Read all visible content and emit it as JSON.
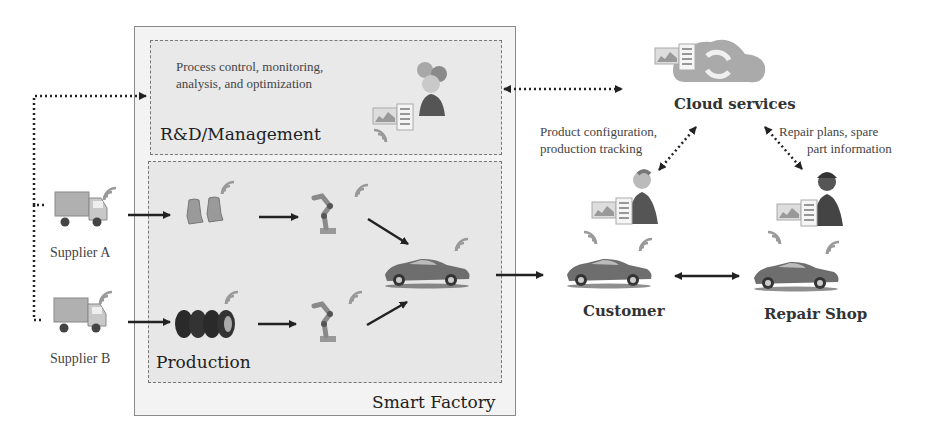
{
  "diagram": {
    "smart_factory": {
      "label": "Smart Factory"
    },
    "rnd": {
      "title": "R&D/Management",
      "description_line1": "Process control, monitoring,",
      "description_line2": "analysis, and optimization"
    },
    "production": {
      "title": "Production",
      "items": [
        "seats",
        "tires",
        "robot-arm-1",
        "robot-arm-2",
        "car"
      ]
    },
    "suppliers": [
      {
        "label": "Supplier A"
      },
      {
        "label": "Supplier B"
      }
    ],
    "cloud": {
      "label": "Cloud services"
    },
    "customer": {
      "label": "Customer",
      "link_label_line1": "Product configuration,",
      "link_label_line2": "production tracking"
    },
    "repair_shop": {
      "label": "Repair Shop",
      "link_label_line1": "Repair plans, spare",
      "link_label_line2": "part information"
    },
    "colors": {
      "factory_bg": "#f3f3f3",
      "inner_bg": "#e8e8e8",
      "arrow": "#222222",
      "icon_gray": "#8c8c8c"
    }
  }
}
